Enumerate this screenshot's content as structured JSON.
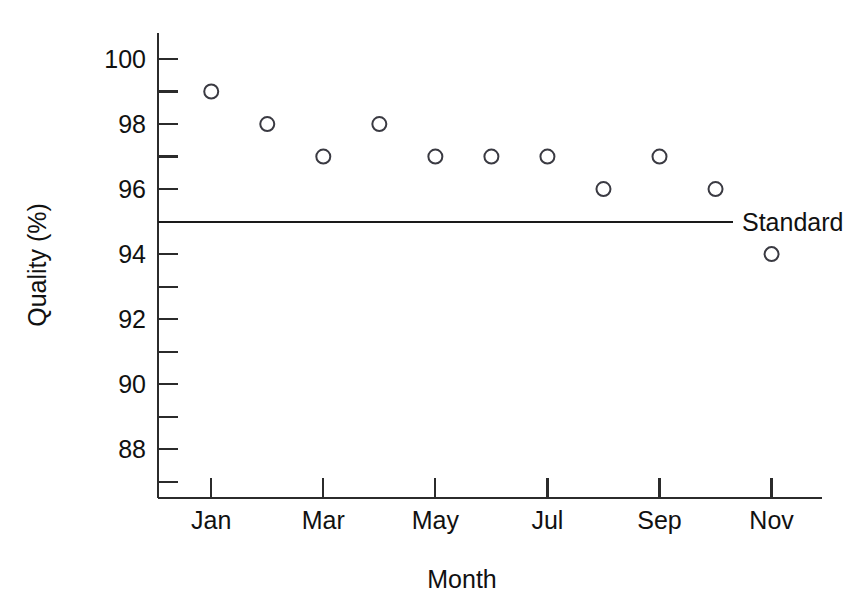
{
  "chart_data": {
    "type": "scatter",
    "title": "",
    "xlabel": "Month",
    "ylabel": "Quality (%)",
    "categories": [
      "Jan",
      "Feb",
      "Mar",
      "Apr",
      "May",
      "Jun",
      "Jul",
      "Aug",
      "Sep",
      "Oct",
      "Nov"
    ],
    "x": [
      1,
      2,
      3,
      4,
      5,
      6,
      7,
      8,
      9,
      10,
      11
    ],
    "values": [
      99,
      98,
      97,
      98,
      97,
      97,
      97,
      96,
      97,
      96,
      94
    ],
    "series": [
      {
        "name": "Quality",
        "marker": "open-circle",
        "values": [
          99,
          98,
          97,
          98,
          97,
          97,
          97,
          96,
          97,
          96,
          94
        ]
      }
    ],
    "reference_lines": [
      {
        "name": "Standard",
        "label": "Standard",
        "value": 95,
        "orientation": "horizontal"
      }
    ],
    "ylim": [
      86.5,
      100.8
    ],
    "xlim": [
      0.05,
      11.9
    ],
    "y_major_ticks": [
      100,
      98,
      96,
      94,
      92,
      90,
      88
    ],
    "y_minor_ticks": [
      99,
      97,
      95,
      93,
      91,
      89,
      87
    ],
    "y_tick_labels": [
      "100",
      "98",
      "96",
      "94",
      "92",
      "90",
      "88"
    ],
    "x_major_ticks": [
      1,
      3,
      5,
      7,
      9,
      11
    ],
    "x_tick_labels": [
      "Jan",
      "Mar",
      "May",
      "Jul",
      "Sep",
      "Nov"
    ],
    "grid": false,
    "legend": "inline-right",
    "colors": {
      "axis": "#2b2b2b",
      "marker_stroke": "#3a3a42",
      "reference_line": "#1a1a1a",
      "text": "#111111",
      "background": "#ffffff"
    }
  }
}
